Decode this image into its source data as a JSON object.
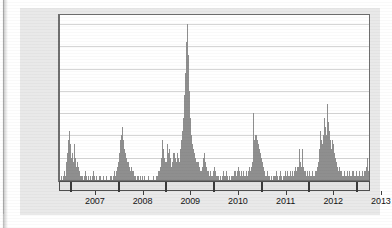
{
  "figure": {
    "background_color": "#e9e9e9",
    "plot_background_color": "#ffffff",
    "bar_color": "#8f8f8f",
    "grid_color": "#d6d6d6",
    "axis_color": "#6f6f6f"
  },
  "chart_data": {
    "type": "bar",
    "title": "",
    "subtitle": "",
    "xlabel": "",
    "ylabel": "Number of pediatric deaths",
    "ylim": [
      0,
      37
    ],
    "yticks": [
      0,
      5,
      10,
      15,
      20,
      25,
      30,
      35
    ],
    "ytick_labels": [
      "0",
      "5",
      "10",
      "15",
      "20",
      "25",
      "30",
      "35"
    ],
    "grid": "horizontal",
    "legend": "none",
    "xtick_labels": [
      "2007",
      "2008",
      "2009",
      "2010",
      "2011",
      "2012",
      "2013"
    ],
    "x_axis_kind": "weekly-time-series-with-year-bands",
    "x_start": "2006-10",
    "x_end": "2013-09",
    "n_points": 364,
    "series": [
      {
        "name": "Number of pediatric deaths",
        "values": [
          0,
          1,
          0,
          1,
          2,
          1,
          3,
          4,
          6,
          9,
          11,
          8,
          5,
          6,
          4,
          8,
          5,
          3,
          4,
          2,
          3,
          2,
          1,
          1,
          1,
          0,
          1,
          2,
          1,
          0,
          1,
          1,
          0,
          1,
          0,
          1,
          2,
          1,
          0,
          1,
          0,
          0,
          1,
          0,
          1,
          0,
          0,
          1,
          0,
          0,
          1,
          0,
          0,
          0,
          1,
          0,
          1,
          0,
          1,
          2,
          1,
          2,
          3,
          4,
          6,
          9,
          8,
          10,
          12,
          9,
          7,
          6,
          5,
          4,
          4,
          3,
          2,
          3,
          2,
          1,
          2,
          1,
          1,
          0,
          1,
          1,
          0,
          1,
          0,
          1,
          0,
          0,
          1,
          0,
          0,
          0,
          1,
          0,
          0,
          0,
          0,
          1,
          0,
          0,
          0,
          1,
          1,
          2,
          2,
          3,
          5,
          9,
          7,
          5,
          4,
          3,
          4,
          8,
          6,
          7,
          5,
          3,
          4,
          6,
          6,
          5,
          4,
          3,
          6,
          5,
          4,
          7,
          9,
          11,
          14,
          19,
          24,
          31,
          33,
          35,
          28,
          20,
          14,
          10,
          8,
          7,
          6,
          5,
          4,
          4,
          3,
          4,
          3,
          2,
          2,
          3,
          5,
          6,
          4,
          3,
          2,
          2,
          1,
          1,
          2,
          1,
          1,
          2,
          3,
          2,
          1,
          1,
          1,
          0,
          1,
          1,
          0,
          1,
          2,
          1,
          1,
          2,
          1,
          0,
          1,
          0,
          1,
          0,
          1,
          1,
          2,
          2,
          1,
          2,
          3,
          2,
          1,
          2,
          1,
          1,
          2,
          1,
          1,
          2,
          1,
          2,
          3,
          2,
          3,
          4,
          10,
          15,
          9,
          10,
          10,
          9,
          8,
          7,
          6,
          5,
          4,
          3,
          2,
          2,
          1,
          1,
          2,
          1,
          1,
          0,
          1,
          0,
          1,
          1,
          0,
          1,
          2,
          1,
          0,
          1,
          2,
          1,
          0,
          1,
          1,
          2,
          1,
          1,
          2,
          1,
          1,
          2,
          1,
          2,
          1,
          2,
          3,
          2,
          3,
          2,
          3,
          7,
          4,
          3,
          7,
          3,
          2,
          2,
          1,
          2,
          1,
          1,
          2,
          1,
          1,
          2,
          1,
          1,
          2,
          2,
          3,
          4,
          5,
          7,
          11,
          9,
          8,
          10,
          14,
          12,
          10,
          17,
          13,
          11,
          9,
          8,
          7,
          9,
          8,
          6,
          5,
          4,
          3,
          2,
          3,
          2,
          1,
          2,
          1,
          1,
          2,
          1,
          1,
          2,
          1,
          2,
          1,
          1,
          2,
          1,
          2,
          1,
          1,
          2,
          1,
          1,
          2,
          1,
          1,
          2,
          1,
          2,
          1,
          2,
          3,
          5,
          2
        ]
      }
    ],
    "year_band_boundaries": [
      "2007",
      "2008",
      "2009",
      "2010",
      "2011",
      "2012",
      "2013"
    ],
    "peaks": [
      {
        "label": "2006-07 season peak",
        "value": 11
      },
      {
        "label": "2007-08 season peak",
        "value": 12
      },
      {
        "label": "2009 H1N1 pandemic peak",
        "value": 35
      },
      {
        "label": "2010-11 season peak",
        "value": 15
      },
      {
        "label": "2011-12 season peak",
        "value": 7
      },
      {
        "label": "2012-13 season peak",
        "value": 17
      }
    ]
  }
}
